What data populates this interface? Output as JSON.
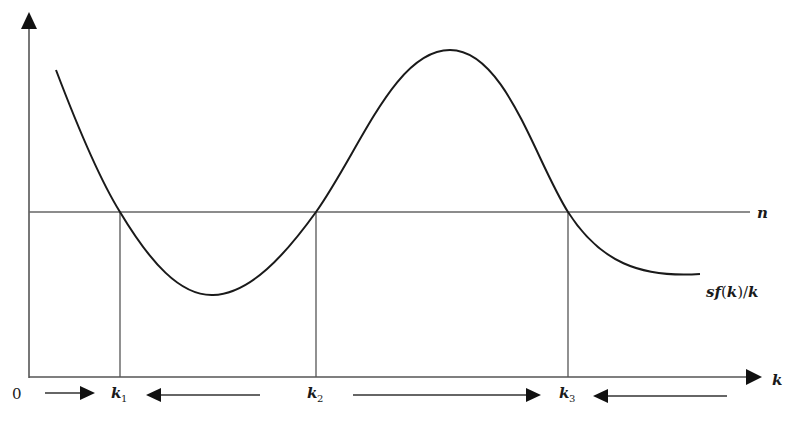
{
  "diagram": {
    "type": "solow-growth-multiple-equilibria",
    "axes": {
      "x_label": "k",
      "origin_label": "0"
    },
    "horizontal_line": {
      "label": "n",
      "y_px": 212
    },
    "curve": {
      "label": "sf(k)/k",
      "points_px": [
        [
          56,
          70
        ],
        [
          120,
          212
        ],
        [
          213,
          295
        ],
        [
          316,
          212
        ],
        [
          450,
          50
        ],
        [
          568,
          212
        ],
        [
          700,
          275
        ]
      ]
    },
    "equilibria": [
      {
        "label": "k",
        "sub": "1",
        "x_px": 120
      },
      {
        "label": "k",
        "sub": "2",
        "x_px": 316
      },
      {
        "label": "k",
        "sub": "3",
        "x_px": 568
      }
    ],
    "dynamics_arrows": [
      {
        "from_px": 45,
        "to_px": 95,
        "direction": "right"
      },
      {
        "from_px": 260,
        "to_px": 146,
        "direction": "left"
      },
      {
        "from_px": 353,
        "to_px": 540,
        "direction": "right"
      },
      {
        "from_px": 727,
        "to_px": 593,
        "direction": "left"
      }
    ],
    "colors": {
      "curve": "#1a1a1a",
      "axes": "#333333",
      "lines": "#555555"
    }
  }
}
